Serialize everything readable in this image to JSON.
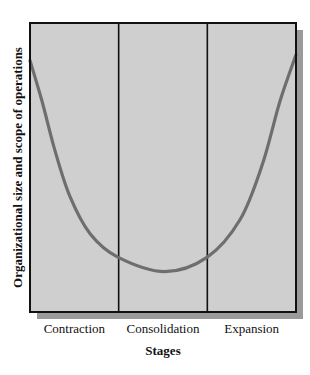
{
  "chart_data": {
    "type": "line",
    "title": "",
    "xlabel": "Stages",
    "ylabel": "Organizational size and scope of operations",
    "categories": [
      "Contraction",
      "Consolidation",
      "Expansion"
    ],
    "xlim": [
      0,
      3
    ],
    "ylim": [
      0,
      1
    ],
    "grid": false,
    "legend": "none",
    "series": [
      {
        "name": "Organizational size",
        "x": [
          0,
          0.135,
          0.28,
          0.45,
          0.68,
          0.99,
          1.52,
          2.0,
          2.37,
          2.62,
          2.82,
          3.0
        ],
        "y": [
          0.87,
          0.73,
          0.56,
          0.4,
          0.27,
          0.19,
          0.14,
          0.19,
          0.32,
          0.51,
          0.73,
          0.89
        ]
      }
    ],
    "colors": {
      "plot_background": "#cfcfcf",
      "shadow": "#9a9a9a",
      "frame": "#111111",
      "curve": "#6e6e6e"
    }
  }
}
